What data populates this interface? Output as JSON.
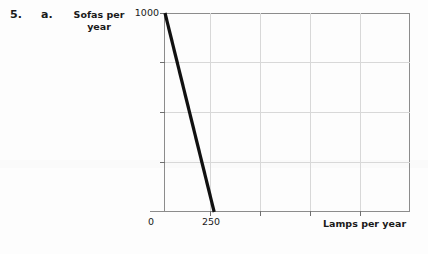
{
  "exercise": {
    "number": "5.",
    "part": "a."
  },
  "chart_data": {
    "type": "line",
    "title": "",
    "xlabel": "Lamps per year",
    "ylabel": "Sofas per year",
    "xlim": [
      0,
      1250
    ],
    "ylim": [
      0,
      1000
    ],
    "grid": true,
    "legend": null,
    "x_ticks": [
      {
        "value": 0,
        "label": "0"
      },
      {
        "value": 250,
        "label": "250"
      }
    ],
    "y_ticks": [
      {
        "value": 1000,
        "label": "1000"
      },
      {
        "value": 750,
        "label": ""
      },
      {
        "value": 500,
        "label": ""
      },
      {
        "value": 250,
        "label": ""
      }
    ],
    "series": [
      {
        "name": "Production possibilities frontier",
        "color": "#111111",
        "x": [
          0,
          250
        ],
        "y": [
          1000,
          0
        ]
      }
    ]
  },
  "colors": {
    "line": "#111111",
    "frame": "#8c8c8c",
    "grid": "#d8d8d8",
    "text": "#1a1a1a",
    "background": "#fdfdfd"
  }
}
